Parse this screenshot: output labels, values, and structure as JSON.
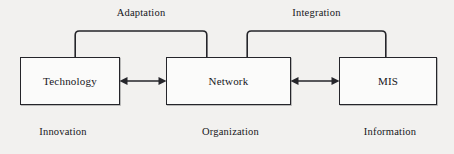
{
  "diagram": {
    "type": "block-relationship-diagram",
    "background_color": "#f2f1ef",
    "line_color": "#25252a",
    "nodes": [
      {
        "id": "technology",
        "label": "Technology",
        "sublabel": "Innovation"
      },
      {
        "id": "network",
        "label": "Network",
        "sublabel": "Organization"
      },
      {
        "id": "mis",
        "label": "MIS",
        "sublabel": "Information"
      }
    ],
    "connectors": [
      {
        "id": "tech-network",
        "from": "technology",
        "to": "network",
        "style": "double-headed-arrow"
      },
      {
        "id": "network-mis",
        "from": "network",
        "to": "mis",
        "style": "double-headed-arrow"
      }
    ],
    "brackets": [
      {
        "id": "adaptation",
        "label": "Adaptation",
        "spans": [
          "technology",
          "network"
        ]
      },
      {
        "id": "integration",
        "label": "Integration",
        "spans": [
          "network",
          "mis"
        ]
      }
    ]
  }
}
